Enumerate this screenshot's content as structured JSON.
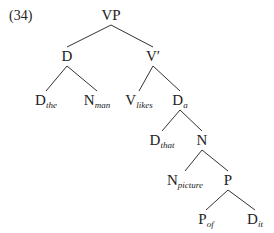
{
  "example_number": "(34)",
  "tree": {
    "nodes": [
      {
        "id": "VP",
        "cat": "VP",
        "sub": "",
        "x": 111,
        "y": 8
      },
      {
        "id": "D",
        "cat": "D",
        "sub": "",
        "x": 67,
        "y": 49
      },
      {
        "id": "Vbar",
        "cat": "V′",
        "sub": "",
        "x": 153,
        "y": 49
      },
      {
        "id": "D_the",
        "cat": "D",
        "sub": "the",
        "x": 46,
        "y": 93
      },
      {
        "id": "N_man",
        "cat": "N",
        "sub": "man",
        "x": 97,
        "y": 93
      },
      {
        "id": "V_likes",
        "cat": "V",
        "sub": "likes",
        "x": 139,
        "y": 93
      },
      {
        "id": "D_a",
        "cat": "D",
        "sub": "a",
        "x": 180,
        "y": 93
      },
      {
        "id": "D_that",
        "cat": "D",
        "sub": "that",
        "x": 162,
        "y": 133
      },
      {
        "id": "N",
        "cat": "N",
        "sub": "",
        "x": 202,
        "y": 133
      },
      {
        "id": "N_picture",
        "cat": "N",
        "sub": "picture",
        "x": 185,
        "y": 173
      },
      {
        "id": "P",
        "cat": "P",
        "sub": "",
        "x": 228,
        "y": 173
      },
      {
        "id": "P_of",
        "cat": "P",
        "sub": "of",
        "x": 206,
        "y": 212
      },
      {
        "id": "D_it",
        "cat": "D",
        "sub": "it",
        "x": 255,
        "y": 212
      }
    ],
    "edges": [
      [
        "VP",
        "D"
      ],
      [
        "VP",
        "Vbar"
      ],
      [
        "D",
        "D_the"
      ],
      [
        "D",
        "N_man"
      ],
      [
        "Vbar",
        "V_likes"
      ],
      [
        "Vbar",
        "D_a"
      ],
      [
        "D_a",
        "D_that"
      ],
      [
        "D_a",
        "N"
      ],
      [
        "N",
        "N_picture"
      ],
      [
        "N",
        "P"
      ],
      [
        "P",
        "P_of"
      ],
      [
        "P",
        "D_it"
      ]
    ]
  }
}
